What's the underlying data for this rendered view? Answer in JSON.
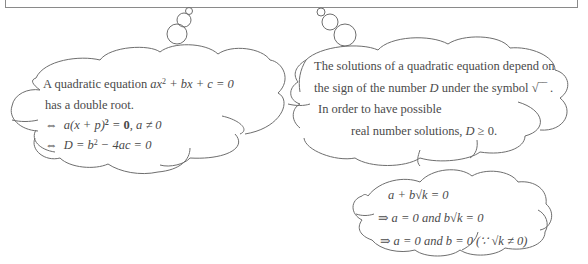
{
  "cloud_left": {
    "line1_text": "A quadratic equation ",
    "line1_math_a": "ax",
    "line1_math_exp": "2",
    "line1_math_b": " + bx + c = 0",
    "line2": "has a double root.",
    "line3_sym": "⇔",
    "line3_math_a": "a(x + p)",
    "line3_exp": "2",
    "line3_eq": " = ",
    "line3_bold": "0",
    "line3_rest": ", a ≠ 0",
    "line4_sym": "⇔",
    "line4_math_a": "D = b",
    "line4_exp": "2",
    "line4_math_b": " − 4ac = 0"
  },
  "cloud_right": {
    "line1": "The solutions of a quadratic equation depend on",
    "line2_a": "the sign of the number ",
    "line2_D": "D",
    "line2_b": " under the symbol √‾‾ .",
    "line3": "In order to have possible",
    "line4_a": "real number solutions,  ",
    "line4_D": "D",
    "line4_b": " ≥ 0."
  },
  "cloud_bottom": {
    "line1": "a + b√k = 0",
    "line2": "⇒ a = 0  and  b√k = 0",
    "line3": "⇒ a = 0  and  b = 0 (∵  √k ≠ 0)"
  },
  "colors": {
    "stroke": "#6e6e6e",
    "text": "#4a4a4a",
    "background": "#ffffff"
  }
}
